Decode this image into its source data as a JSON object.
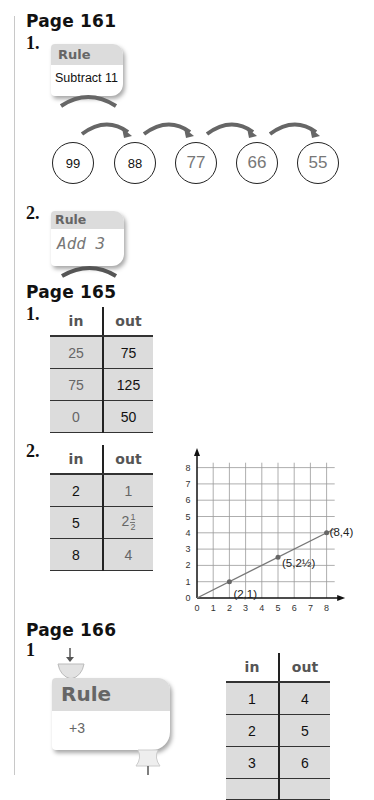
{
  "sections": [
    {
      "heading": "Page 161",
      "problems": [
        {
          "number": "1.",
          "rule_title": "Rule",
          "rule_text": "Subtract 11",
          "sequence": [
            {
              "value": "99",
              "given": true
            },
            {
              "value": "88",
              "given": true
            },
            {
              "value": "77",
              "given": false
            },
            {
              "value": "66",
              "given": false
            },
            {
              "value": "55",
              "given": false
            }
          ]
        },
        {
          "number": "2.",
          "rule_title": "Rule",
          "rule_text": "Add 3"
        }
      ]
    },
    {
      "heading": "Page 165",
      "problems": [
        {
          "number": "1.",
          "table": {
            "headers": [
              "in",
              "out"
            ],
            "rows": [
              [
                "25",
                "75"
              ],
              [
                "75",
                "125"
              ],
              [
                "0",
                "50"
              ]
            ]
          }
        },
        {
          "number": "2.",
          "table": {
            "headers": [
              "in",
              "out"
            ],
            "rows": [
              [
                "2",
                "1"
              ],
              [
                "5",
                "2",
                "1",
                "2"
              ],
              [
                "8",
                "4"
              ]
            ]
          }
        }
      ]
    },
    {
      "heading": "Page 166",
      "problems": [
        {
          "number": "1",
          "rule_title": "Rule",
          "rule_text": "+3",
          "table": {
            "headers": [
              "in",
              "out"
            ],
            "rows": [
              [
                "1",
                "4"
              ],
              [
                "2",
                "5"
              ],
              [
                "3",
                "6"
              ]
            ]
          }
        }
      ]
    }
  ],
  "chart_data": {
    "type": "line",
    "title": "",
    "xlabel": "",
    "ylabel": "",
    "x_ticks": [
      "0",
      "1",
      "2",
      "3",
      "4",
      "5",
      "6",
      "7",
      "8"
    ],
    "y_ticks": [
      "0",
      "1",
      "2",
      "3",
      "4",
      "5",
      "6",
      "7",
      "8"
    ],
    "xlim": [
      0,
      8.5
    ],
    "ylim": [
      0,
      8.3
    ],
    "grid": true,
    "series": [
      {
        "name": "out = in / 2",
        "x": [
          0,
          8.5
        ],
        "y": [
          0,
          4.25
        ]
      }
    ],
    "points": [
      {
        "x": 2,
        "y": 1,
        "label": "(2,1)"
      },
      {
        "x": 5,
        "y": 2.5,
        "label": "(5,2½)"
      },
      {
        "x": 8,
        "y": 4,
        "label": "(8,4)"
      }
    ]
  }
}
